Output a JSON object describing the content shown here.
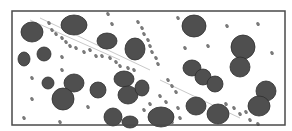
{
  "image": {
    "background": "#ffffff",
    "frame": {
      "x": 12,
      "y": 11,
      "w": 273,
      "h": 114,
      "stroke": "#4a4a4a",
      "width": 1.5
    },
    "cell_fill": "#4f4f4f",
    "cell_stroke": "#2e2e2e",
    "platelet_fill": "#7a7a7a",
    "streak_color": "#c9c9c9",
    "cells": [
      {
        "cx": 32,
        "cy": 32,
        "rx": 11,
        "ry": 10
      },
      {
        "cx": 74,
        "cy": 25,
        "rx": 13,
        "ry": 10
      },
      {
        "cx": 24,
        "cy": 59,
        "rx": 6,
        "ry": 7
      },
      {
        "cx": 44,
        "cy": 54,
        "rx": 7,
        "ry": 7
      },
      {
        "cx": 107,
        "cy": 41,
        "rx": 10,
        "ry": 8
      },
      {
        "cx": 135,
        "cy": 49,
        "rx": 10,
        "ry": 11
      },
      {
        "cx": 48,
        "cy": 83,
        "rx": 6,
        "ry": 6
      },
      {
        "cx": 74,
        "cy": 83,
        "rx": 10,
        "ry": 9
      },
      {
        "cx": 63,
        "cy": 99,
        "rx": 11,
        "ry": 11
      },
      {
        "cx": 98,
        "cy": 90,
        "rx": 8,
        "ry": 8
      },
      {
        "cx": 124,
        "cy": 79,
        "rx": 10,
        "ry": 8
      },
      {
        "cx": 128,
        "cy": 95,
        "rx": 10,
        "ry": 9
      },
      {
        "cx": 142,
        "cy": 88,
        "rx": 7,
        "ry": 8
      },
      {
        "cx": 113,
        "cy": 117,
        "rx": 9,
        "ry": 9
      },
      {
        "cx": 130,
        "cy": 122,
        "rx": 8,
        "ry": 6
      },
      {
        "cx": 194,
        "cy": 26,
        "rx": 12,
        "ry": 11
      },
      {
        "cx": 243,
        "cy": 47,
        "rx": 12,
        "ry": 12
      },
      {
        "cx": 240,
        "cy": 67,
        "rx": 10,
        "ry": 10
      },
      {
        "cx": 192,
        "cy": 68,
        "rx": 9,
        "ry": 8
      },
      {
        "cx": 203,
        "cy": 77,
        "rx": 8,
        "ry": 8
      },
      {
        "cx": 215,
        "cy": 84,
        "rx": 8,
        "ry": 8
      },
      {
        "cx": 266,
        "cy": 91,
        "rx": 10,
        "ry": 10
      },
      {
        "cx": 259,
        "cy": 106,
        "rx": 11,
        "ry": 10
      },
      {
        "cx": 196,
        "cy": 106,
        "rx": 10,
        "ry": 9
      },
      {
        "cx": 218,
        "cy": 114,
        "rx": 11,
        "ry": 10
      },
      {
        "cx": 161,
        "cy": 117,
        "rx": 13,
        "ry": 10
      }
    ],
    "platelets": [
      [
        49,
        23
      ],
      [
        52,
        30
      ],
      [
        56,
        34
      ],
      [
        62,
        38
      ],
      [
        66,
        42
      ],
      [
        70,
        46
      ],
      [
        76,
        48
      ],
      [
        84,
        52
      ],
      [
        90,
        50
      ],
      [
        96,
        56
      ],
      [
        102,
        56
      ],
      [
        110,
        58
      ],
      [
        116,
        62
      ],
      [
        120,
        66
      ],
      [
        128,
        68
      ],
      [
        134,
        70
      ],
      [
        138,
        22
      ],
      [
        142,
        28
      ],
      [
        144,
        34
      ],
      [
        148,
        40
      ],
      [
        150,
        46
      ],
      [
        152,
        52
      ],
      [
        156,
        58
      ],
      [
        158,
        64
      ],
      [
        112,
        24
      ],
      [
        108,
        14
      ],
      [
        62,
        57
      ],
      [
        62,
        70
      ],
      [
        32,
        78
      ],
      [
        32,
        99
      ],
      [
        24,
        118
      ],
      [
        88,
        107
      ],
      [
        60,
        122
      ],
      [
        178,
        18
      ],
      [
        227,
        26
      ],
      [
        258,
        24
      ],
      [
        185,
        48
      ],
      [
        208,
        46
      ],
      [
        272,
        53
      ],
      [
        168,
        80
      ],
      [
        172,
        86
      ],
      [
        176,
        92
      ],
      [
        160,
        96
      ],
      [
        166,
        102
      ],
      [
        150,
        104
      ],
      [
        178,
        108
      ],
      [
        144,
        110
      ],
      [
        226,
        104
      ],
      [
        234,
        108
      ],
      [
        240,
        114
      ],
      [
        246,
        112
      ],
      [
        250,
        120
      ],
      [
        258,
        124
      ],
      [
        180,
        118
      ],
      [
        172,
        122
      ]
    ],
    "streaks": [
      [
        40,
        18,
        150,
        70
      ],
      [
        30,
        20,
        120,
        60
      ],
      [
        160,
        80,
        240,
        118
      ]
    ]
  }
}
